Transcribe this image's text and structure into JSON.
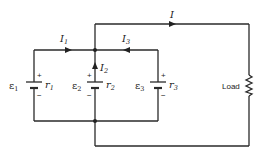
{
  "diagram": {
    "type": "circuit",
    "currents": {
      "main": {
        "symbol": "I",
        "subscript": ""
      },
      "i1": {
        "symbol": "I",
        "subscript": "1"
      },
      "i2": {
        "symbol": "I",
        "subscript": "2"
      },
      "i3": {
        "symbol": "I",
        "subscript": "3"
      }
    },
    "batteries": [
      {
        "emf": "ε",
        "emf_sub": "1",
        "r": "r",
        "r_sub": "1",
        "plus": "+",
        "minus": "−"
      },
      {
        "emf": "ε",
        "emf_sub": "2",
        "r": "r",
        "r_sub": "2",
        "plus": "+",
        "minus": "−"
      },
      {
        "emf": "ε",
        "emf_sub": "3",
        "r": "r",
        "r_sub": "3",
        "plus": "+",
        "minus": "−"
      }
    ],
    "load": {
      "label": "Load"
    },
    "colors": {
      "wire": "#2a2a2a",
      "background": "#ffffff"
    }
  }
}
